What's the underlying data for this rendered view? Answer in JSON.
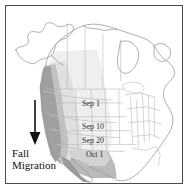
{
  "figure": {
    "name": "fall-migration-isochrone-map",
    "region": "North America"
  },
  "annotation": {
    "arrow_direction": "down",
    "caption_line_1": "Fall",
    "caption_line_2": "Migration"
  },
  "isochrones": [
    {
      "label": "Sep 1"
    },
    {
      "label": "Sep 10"
    },
    {
      "label": "Sep 20"
    },
    {
      "label": "Oct 1"
    }
  ],
  "colors": {
    "frame_border": "#4a4a4a",
    "coastline": "#9a9a9a",
    "state_border": "#b5b5b5",
    "shade_light": "#ededed",
    "shade_mid": "#dedede",
    "shade_dark": "#bdbdbd",
    "shade_darkest": "#9e9e9e",
    "arrow": "#111111",
    "text": "#111111"
  }
}
